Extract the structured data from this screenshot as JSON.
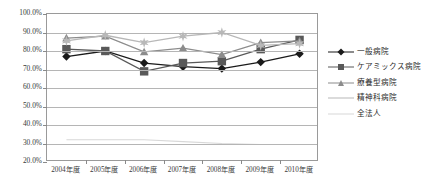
{
  "chart_data": {
    "type": "line",
    "title": "",
    "xlabel": "",
    "ylabel": "",
    "ylim": [
      20,
      100
    ],
    "ytick_labels": [
      "100.0%",
      "90.0%",
      "80.0%",
      "70.0%",
      "60.0%",
      "50.0%",
      "40.0%",
      "30.0%",
      "20.0%"
    ],
    "ytick_values": [
      100,
      90,
      80,
      70,
      60,
      50,
      40,
      30,
      20
    ],
    "grid": true,
    "legend_position": "right",
    "categories": [
      "2004年度",
      "2005年度",
      "2006年度",
      "2007年度",
      "2008年度",
      "2009年度",
      "2010年度"
    ],
    "series": [
      {
        "name": "一般病院",
        "color": "#1a1a1a",
        "marker": "diamond",
        "values": [
          77.0,
          80.0,
          73.5,
          71.5,
          70.5,
          74.0,
          78.5
        ]
      },
      {
        "name": "ケアミックス病院",
        "color": "#595959",
        "marker": "square",
        "values": [
          81.0,
          80.0,
          69.0,
          73.5,
          74.5,
          81.0,
          86.0
        ]
      },
      {
        "name": "療養型病院",
        "color": "#8c8c8c",
        "marker": "triangle",
        "values": [
          87.0,
          88.0,
          79.5,
          81.5,
          78.0,
          84.5,
          85.5
        ]
      },
      {
        "name": "精神科病院",
        "color": "#b8b8b8",
        "marker": "star",
        "values": [
          85.5,
          88.5,
          84.5,
          88.0,
          90.0,
          83.0,
          84.0
        ]
      },
      {
        "name": "全法人",
        "color": "#d8d8d8",
        "marker": "none",
        "values": [
          32.0,
          32.0,
          32.0,
          31.0,
          30.0,
          29.5,
          29.5
        ]
      }
    ]
  },
  "colors": {
    "axis": "#9a9a9a",
    "grid": "#b5b5b5",
    "text": "#333333",
    "background": "#ffffff"
  }
}
